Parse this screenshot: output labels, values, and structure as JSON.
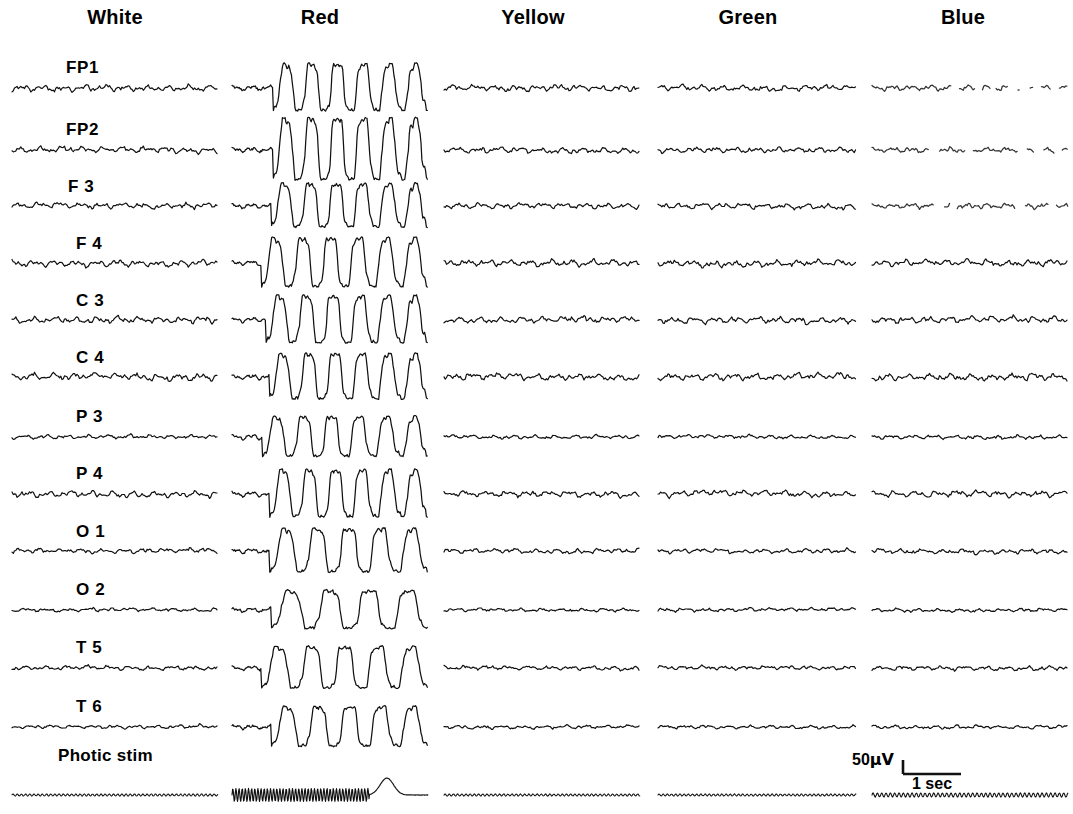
{
  "figure": {
    "type": "eeg-multichannel-recording"
  },
  "columns": [
    {
      "label": "White",
      "center_x": 115
    },
    {
      "label": "Red",
      "center_x": 320
    },
    {
      "label": "Yellow",
      "center_x": 533
    },
    {
      "label": "Green",
      "center_x": 748
    },
    {
      "label": "Blue",
      "center_x": 963
    }
  ],
  "channels": [
    {
      "label": "FP1",
      "baseline_y": 88
    },
    {
      "label": "FP2",
      "baseline_y": 150
    },
    {
      "label": "F 3",
      "baseline_y": 206
    },
    {
      "label": "F 4",
      "baseline_y": 263
    },
    {
      "label": "C 3",
      "baseline_y": 320
    },
    {
      "label": "C 4",
      "baseline_y": 377
    },
    {
      "label": "P 3",
      "baseline_y": 437
    },
    {
      "label": "P 4",
      "baseline_y": 494
    },
    {
      "label": "O 1",
      "baseline_y": 551
    },
    {
      "label": "O 2",
      "baseline_y": 610
    },
    {
      "label": "T 5",
      "baseline_y": 668
    },
    {
      "label": "T 6",
      "baseline_y": 727
    }
  ],
  "stim_row": {
    "label": "Photic stim",
    "baseline_y": 795,
    "label_x": 58,
    "label_y": 755
  },
  "scale": {
    "amplitude": "50",
    "amplitude_unit": "μV",
    "time": "1 sec",
    "bar_x": 903,
    "bar_y": 760,
    "bar_width": 58,
    "bar_height": 14
  },
  "chart_data": {
    "type": "line",
    "title": "",
    "xlabel": "1 sec",
    "ylabel": "50 μV",
    "grid": false,
    "legend": "none",
    "categories": [
      "White",
      "Red",
      "Yellow",
      "Green",
      "Blue"
    ],
    "series": [
      {
        "name": "FP1",
        "note": "low-amplitude background; large paroxysmal slow waves under Red"
      },
      {
        "name": "FP2",
        "note": "low-amplitude background; very large clipped slow waves under Red"
      },
      {
        "name": "F 3",
        "note": "low-amplitude background; high-amplitude discharge under Red"
      },
      {
        "name": "F 4",
        "note": "low-amplitude background; high-amplitude discharge under Red"
      },
      {
        "name": "C 3",
        "note": "low-amplitude background; high-amplitude discharge under Red"
      },
      {
        "name": "C 4",
        "note": "low-amplitude background; high-amplitude discharge under Red"
      },
      {
        "name": "P 3",
        "note": "low-amplitude background; high-amplitude discharge under Red"
      },
      {
        "name": "P 4",
        "note": "low-amplitude background; high-amplitude discharge under Red"
      },
      {
        "name": "O 1",
        "note": "low-amplitude background; high-amplitude discharge under Red"
      },
      {
        "name": "O 2",
        "note": "low-amplitude background; high-amplitude discharge under Red"
      },
      {
        "name": "T 5",
        "note": "low-amplitude background; high-amplitude discharge under Red"
      },
      {
        "name": "T 6",
        "note": "low-amplitude background; high-amplitude discharge under Red"
      },
      {
        "name": "Photic stim",
        "note": "flash train marker; dense oscillation train under Red"
      }
    ],
    "amplitude_calibration_uV": 50,
    "time_calibration_sec": 1
  }
}
